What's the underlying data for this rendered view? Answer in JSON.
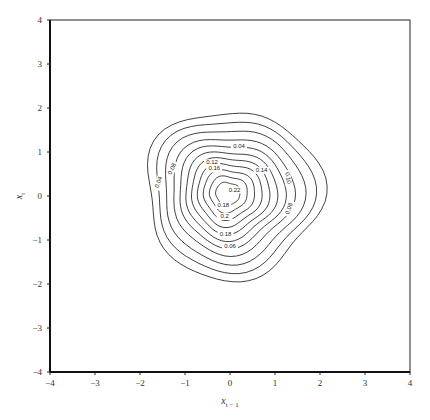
{
  "chart_data": {
    "type": "contour",
    "title": "",
    "xlabel": "x_{t-1}",
    "ylabel": "x_t",
    "xlim": [
      -4,
      4
    ],
    "ylim": [
      -4,
      4
    ],
    "x_ticks": [
      -4,
      -3,
      -2,
      -1,
      0,
      1,
      2,
      3,
      4
    ],
    "y_ticks": [
      -4,
      -3,
      -2,
      -1,
      0,
      1,
      2,
      3,
      4
    ],
    "grid": false,
    "legend": null,
    "center": [
      0,
      0
    ],
    "contour_levels": [
      0.02,
      0.04,
      0.06,
      0.08,
      0.1,
      0.12,
      0.14,
      0.16,
      0.18,
      0.2,
      0.22
    ],
    "contour_labels": [
      "0.04",
      "0.06",
      "0.08",
      "0.10",
      "0.12",
      "0.14",
      "0.16",
      "0.18",
      "0.2",
      "0.22"
    ],
    "approx_radii": [
      1.95,
      1.75,
      1.55,
      1.35,
      1.18,
      1.02,
      0.87,
      0.72,
      0.57,
      0.42,
      0.27
    ]
  },
  "axes": {
    "x_label_main": "x",
    "x_label_sub": "t − 1",
    "y_label_main": "x",
    "y_label_sub": "t",
    "x_tick_labels": [
      "−4",
      "−3",
      "−2",
      "−1",
      "0",
      "1",
      "2",
      "3",
      "4"
    ],
    "y_tick_labels": [
      "4",
      "3",
      "2",
      "1",
      "0",
      "−1",
      "−2",
      "−3",
      "−4"
    ]
  }
}
